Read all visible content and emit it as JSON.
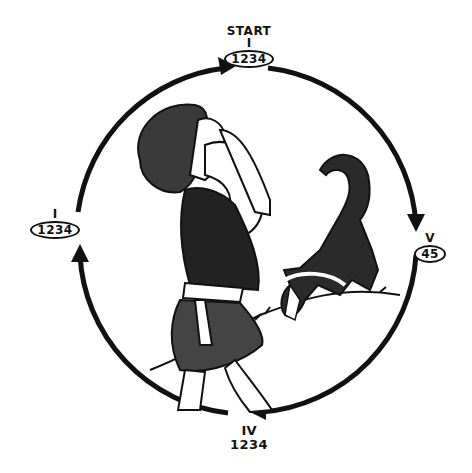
{
  "diagram": {
    "type": "cycle",
    "direction": "clockwise",
    "nodes": [
      {
        "id": "top",
        "position": "top",
        "caption": "START",
        "roman": "I",
        "numbers": "1234",
        "boxed": true
      },
      {
        "id": "right",
        "position": "right",
        "caption": "",
        "roman": "V",
        "numbers": "45",
        "boxed": true
      },
      {
        "id": "bottom",
        "position": "bottom",
        "caption": "",
        "roman": "IV",
        "numbers": "1234",
        "boxed": false
      },
      {
        "id": "left",
        "position": "left",
        "caption": "",
        "roman": "I",
        "numbers": "1234",
        "boxed": true
      }
    ],
    "edges": [
      {
        "from": "left",
        "to": "top"
      },
      {
        "from": "top",
        "to": "right"
      },
      {
        "from": "right",
        "to": "bottom"
      },
      {
        "from": "bottom",
        "to": "left"
      }
    ],
    "illustration": {
      "description": "Line-art drawing of a figure in fur clothing looking upward with hands at face, and a dog sniffing the ground on a hillside",
      "elements": [
        "figure",
        "dog",
        "hill"
      ]
    },
    "colors": {
      "ink": "#111111",
      "background": "#ffffff"
    }
  }
}
